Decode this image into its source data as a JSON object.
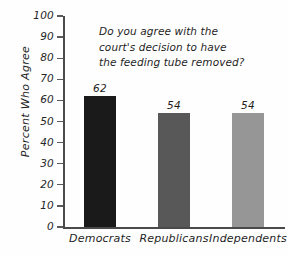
{
  "chart_data": {
    "type": "bar",
    "title": "Do you agree with the court's decision to have the feeding tube removed?",
    "title_lines": [
      "Do you agree with the",
      "court's decision to have",
      "the feeding tube removed?"
    ],
    "xlabel": "",
    "ylabel": "Percent Who Agree",
    "ylim": [
      0,
      100
    ],
    "ytick_step": 10,
    "yticks": [
      100,
      90,
      80,
      70,
      60,
      50,
      40,
      30,
      20,
      10,
      0
    ],
    "ytick_labels": [
      "100",
      "90",
      "80",
      "70",
      "60",
      "50",
      "40",
      "30",
      "20",
      "10",
      "0"
    ],
    "categories": [
      "Democrats",
      "Republicans",
      "Independents"
    ],
    "values": [
      62,
      54,
      54
    ],
    "value_labels": [
      "62",
      "54",
      "54"
    ],
    "bar_colors": [
      "#1a1a1a",
      "#585858",
      "#969696"
    ],
    "grid": false,
    "legend": "none",
    "style": "hand-drawn",
    "axis_color": "#4a4a4a",
    "background_color": "#fefefe",
    "text_color": "#1f1f1f"
  }
}
